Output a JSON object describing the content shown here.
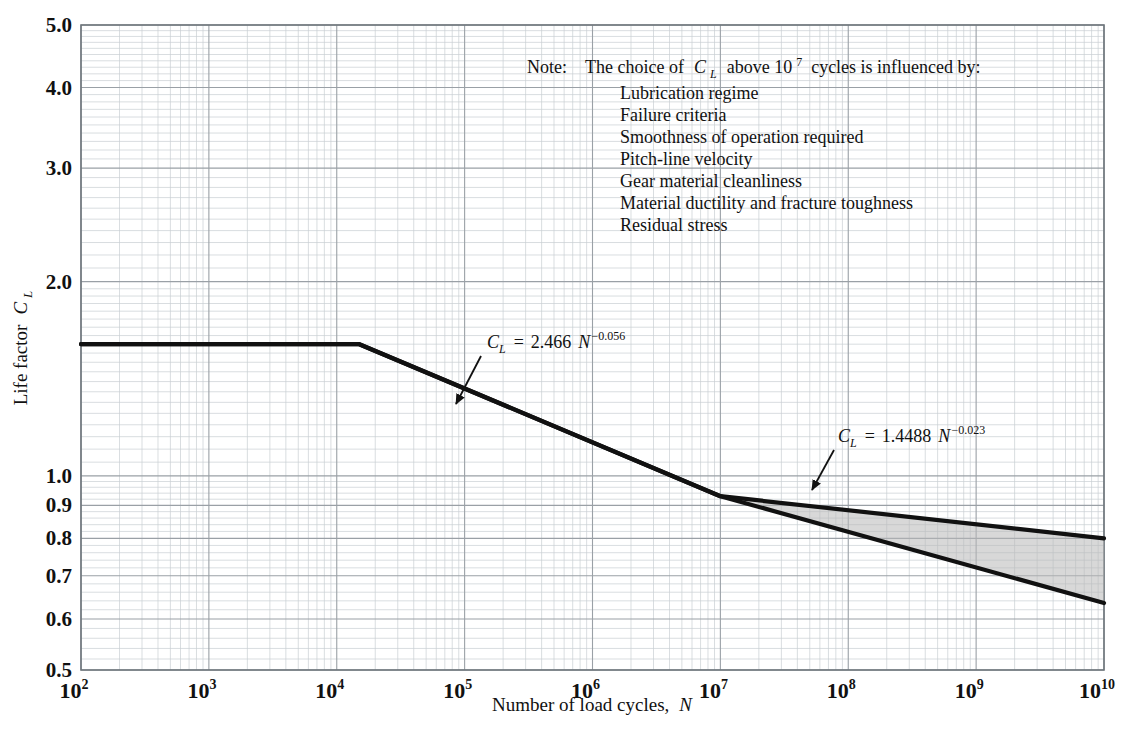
{
  "figure": {
    "background_color": "#ffffff",
    "ink_color": "#111111",
    "grid_major_color": "#9aa0a6",
    "grid_minor_color": "#c9ced3",
    "shade_color": "#b8b8b8"
  },
  "axes": {
    "x_title_main": "Number of load cycles,",
    "x_title_symbol": "N",
    "y_title_main": "Life factor",
    "y_title_symbol": "C",
    "y_title_subscript": "L",
    "x_tick_base": "10",
    "x_tick_exponents": [
      "2",
      "3",
      "4",
      "5",
      "6",
      "7",
      "8",
      "9",
      "10"
    ],
    "y_tick_labels": [
      "5.0",
      "4.0",
      "3.0",
      "2.0",
      "1.0",
      "0.9",
      "0.8",
      "0.7",
      "0.6",
      "0.5"
    ]
  },
  "note": {
    "label": "Note:",
    "lead_part1": "The choice of",
    "lead_symbol": "C",
    "lead_subscript": "L",
    "lead_part2": "above 10",
    "lead_exponent": "7",
    "lead_part3": "cycles is influenced by:",
    "items": [
      "Lubrication regime",
      "Failure criteria",
      "Smoothness of operation required",
      "Pitch-line velocity",
      "Gear material cleanliness",
      "Material ductility and fracture toughness",
      "Residual stress"
    ]
  },
  "annotations": [
    {
      "id": "upper-equation",
      "symbol": "C",
      "subscript": "L",
      "equals": "=",
      "coefficient": "2.466",
      "variable": "N",
      "exponent": "−0.056",
      "text_x": 487,
      "text_y": 348,
      "arrow_from_x": 481,
      "arrow_from_y": 356,
      "arrow_to_x": 456,
      "arrow_to_y": 404
    },
    {
      "id": "lower-equation",
      "symbol": "C",
      "subscript": "L",
      "equals": "=",
      "coefficient": "1.4488",
      "variable": "N",
      "exponent": "−0.023",
      "text_x": 838,
      "text_y": 442,
      "arrow_from_x": 834,
      "arrow_from_y": 450,
      "arrow_to_x": 812,
      "arrow_to_y": 490
    }
  ],
  "chart_data": {
    "type": "line",
    "title": "",
    "xlabel": "Number of load cycles, N",
    "ylabel": "Life factor C_L",
    "xscale": "log",
    "yscale": "log",
    "xlim": [
      100,
      10000000000
    ],
    "ylim": [
      0.5,
      5.0
    ],
    "grid": true,
    "legend": "none",
    "x_tick_values": [
      100,
      1000,
      10000,
      100000,
      1000000,
      10000000,
      100000000,
      1000000000,
      10000000000
    ],
    "y_tick_values": [
      5.0,
      4.0,
      3.0,
      2.0,
      1.0,
      0.9,
      0.8,
      0.7,
      0.6,
      0.5
    ],
    "series": [
      {
        "name": "Upper bound (C_L = 1.4488 N^-0.023)",
        "equation": "C_L = 1.4488 N^-0.023",
        "points": [
          {
            "x": 100,
            "y": 1.6
          },
          {
            "x": 15000,
            "y": 1.6
          },
          {
            "x": 10000000,
            "y": 0.93
          },
          {
            "x": 10000000000,
            "y": 0.8
          }
        ]
      },
      {
        "name": "Lower bound (C_L = 2.466 N^-0.056)",
        "equation": "C_L = 2.466 N^-0.056",
        "points": [
          {
            "x": 100,
            "y": 1.6
          },
          {
            "x": 15000,
            "y": 1.6
          },
          {
            "x": 10000000,
            "y": 0.93
          },
          {
            "x": 10000000000,
            "y": 0.635
          }
        ]
      }
    ],
    "shaded_region": {
      "name": "Range of C_L choice above 10^7 cycles",
      "x_start": 10000000,
      "x_end": 10000000000,
      "upper_y_start": 0.93,
      "upper_y_end": 0.8,
      "lower_y_start": 0.93,
      "lower_y_end": 0.635
    }
  }
}
